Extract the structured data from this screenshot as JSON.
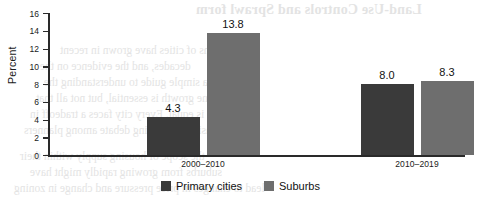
{
  "chart_data": {
    "type": "bar",
    "title": "",
    "xlabel": "",
    "ylabel": "Percent",
    "ylim": [
      0,
      16
    ],
    "ytick_step": 2,
    "yticks": [
      "16",
      "14",
      "12",
      "10",
      "8",
      "6",
      "4",
      "2",
      "0"
    ],
    "grid": false,
    "legend_position": "bottom-center",
    "categories": [
      "2000–2010",
      "2010–2019"
    ],
    "series": [
      {
        "name": "Primary cities",
        "color": "#3a3a3a",
        "values": [
          4.3,
          8.0
        ],
        "labels": [
          "4.3",
          "8.0"
        ]
      },
      {
        "name": "Suburbs",
        "color": "#6e6e6e",
        "values": [
          13.8,
          8.3
        ],
        "labels": [
          "13.8",
          "8.3"
        ]
      }
    ]
  },
  "axis": {
    "y_label": "Percent"
  },
  "background_bleed": {
    "title": "Land-Use Controls and Sprawl form",
    "lines": [
      "Dozens of cities have grown in recent",
      "decades, and the evidence on the",
      "a simple guide to understanding the",
      "Some growth is essential, but not all that",
      "is equal. Every city faces a tradeoff in",
      "density, an ongoing debate among planners",
      "the scope of housing supply within their",
      "suburbs from growing rapidly might have",
      "lead to changes in price pressure and change in zoning"
    ]
  }
}
